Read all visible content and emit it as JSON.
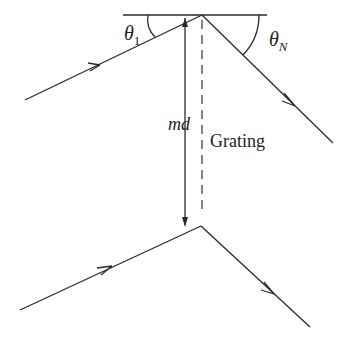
{
  "diagram": {
    "type": "diffraction grating ray geometry",
    "labels": {
      "theta_1": "θ",
      "theta_1_sub": "1",
      "theta_N": "θ",
      "theta_N_sub": "N",
      "md": "md",
      "grating": "Grating"
    },
    "elements": [
      "grating surface line",
      "upper incident ray with arrow",
      "upper diffracted ray with arrow",
      "lower incident ray with arrow",
      "lower diffracted ray with arrow",
      "vertical md double arrow",
      "dashed grating normal"
    ]
  }
}
